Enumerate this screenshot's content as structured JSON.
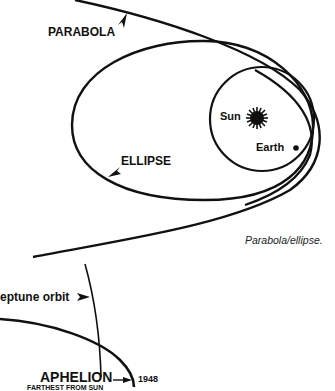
{
  "figure_top": {
    "labels": {
      "parabola": "PARABOLA",
      "ellipse": "ELLIPSE",
      "sun": "Sun",
      "earth": "Earth"
    },
    "caption": "Parabola/ellipse."
  },
  "figure_bottom": {
    "labels": {
      "neptune_orbit": "eptune orbit",
      "aphelion": "APHELION",
      "aphelion_sub": "FARTHEST FROM SUN",
      "year": "1948"
    }
  },
  "colors": {
    "ink": "#111111",
    "background": "#ffffff"
  }
}
